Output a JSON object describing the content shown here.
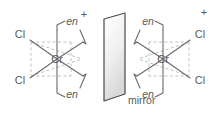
{
  "figure": {
    "background_color": "#ffffff",
    "line_color": "#6a6a6a",
    "dashed_line_color": "#b9b9b9",
    "text_color": "#5a5a5a",
    "mirror_fill_top": "#ffffff",
    "mirror_fill_bottom": "#d8d8d8",
    "mirror_edge_color": "#4a4a4a"
  },
  "mirror": {
    "label": "mirror"
  },
  "left_complex": {
    "metal_label": "Cr",
    "charge_label": "+",
    "ligands": [
      {
        "label": "Cl",
        "position": "upper-left"
      },
      {
        "label": "Cl",
        "position": "lower-left"
      },
      {
        "label": "en",
        "position": "upper-right"
      },
      {
        "label": "en",
        "position": "lower-right"
      }
    ]
  },
  "right_complex": {
    "metal_label": "Cr",
    "charge_label": "+",
    "ligands": [
      {
        "label": "en",
        "position": "upper-left"
      },
      {
        "label": "en",
        "position": "lower-left"
      },
      {
        "label": "Cl",
        "position": "upper-right"
      },
      {
        "label": "Cl",
        "position": "lower-right"
      }
    ]
  }
}
